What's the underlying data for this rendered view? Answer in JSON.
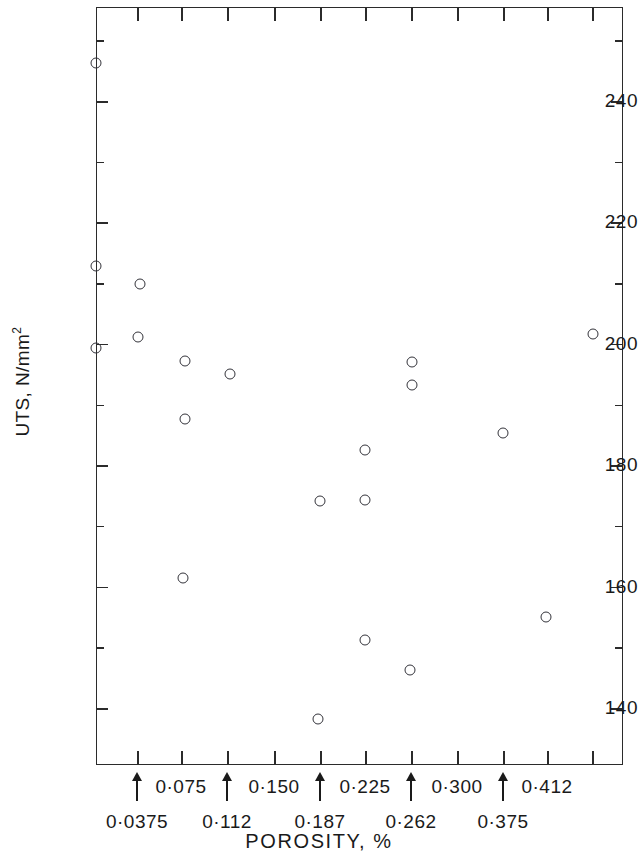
{
  "chart_data": {
    "type": "scatter",
    "title": "",
    "xlabel": "POROSITY, %",
    "ylabel": "UTS, N/mm2",
    "ylabel_display": "UTS, N/mm",
    "ylabel_exponent": "2",
    "xlim": [
      0.0,
      0.45
    ],
    "ylim": [
      133,
      252
    ],
    "grid": false,
    "legend": null,
    "y_major_ticks": [
      140,
      160,
      180,
      200,
      220,
      240
    ],
    "y_tick_labels": [
      "140",
      "160",
      "180",
      "200",
      "220",
      "240"
    ],
    "y_minor_ticks": [
      150,
      170,
      190,
      210,
      230,
      250
    ],
    "x_tick_labels_upper": [
      "0·075",
      "0·150",
      "0·225",
      "0·300",
      "0·412"
    ],
    "x_tick_labels_lower": [
      "0·0375",
      "0·112",
      "0·187",
      "0·262",
      "0·375"
    ],
    "x_arrow_positions_px": [
      137,
      227,
      320,
      411,
      503
    ],
    "x_tick_positions_px": [
      137,
      181,
      227,
      274,
      320,
      365,
      411,
      457,
      503,
      547,
      592
    ],
    "points": [
      {
        "x_px": 96,
        "y_px": 63,
        "porosity": 0.0,
        "uts": 246
      },
      {
        "x_px": 96,
        "y_px": 266,
        "porosity": 0.0,
        "uts": 212
      },
      {
        "x_px": 96,
        "y_px": 348,
        "porosity": 0.0,
        "uts": 199
      },
      {
        "x_px": 140,
        "y_px": 284,
        "porosity": 0.038,
        "uts": 209
      },
      {
        "x_px": 138,
        "y_px": 337,
        "porosity": 0.036,
        "uts": 201
      },
      {
        "x_px": 185,
        "y_px": 361,
        "porosity": 0.077,
        "uts": 197
      },
      {
        "x_px": 185,
        "y_px": 419,
        "porosity": 0.077,
        "uts": 187
      },
      {
        "x_px": 183,
        "y_px": 578,
        "porosity": 0.076,
        "uts": 161
      },
      {
        "x_px": 230,
        "y_px": 374,
        "porosity": 0.115,
        "uts": 195
      },
      {
        "x_px": 320,
        "y_px": 501,
        "porosity": 0.192,
        "uts": 174
      },
      {
        "x_px": 318,
        "y_px": 719,
        "porosity": 0.19,
        "uts": 138
      },
      {
        "x_px": 365,
        "y_px": 450,
        "porosity": 0.23,
        "uts": 182
      },
      {
        "x_px": 365,
        "y_px": 500,
        "porosity": 0.23,
        "uts": 174
      },
      {
        "x_px": 365,
        "y_px": 640,
        "porosity": 0.23,
        "uts": 151
      },
      {
        "x_px": 410,
        "y_px": 670,
        "porosity": 0.268,
        "uts": 146
      },
      {
        "x_px": 412,
        "y_px": 362,
        "porosity": 0.27,
        "uts": 197
      },
      {
        "x_px": 412,
        "y_px": 385,
        "porosity": 0.27,
        "uts": 193
      },
      {
        "x_px": 503,
        "y_px": 433,
        "porosity": 0.348,
        "uts": 185
      },
      {
        "x_px": 546,
        "y_px": 617,
        "porosity": 0.385,
        "uts": 156
      },
      {
        "x_px": 593,
        "y_px": 334,
        "porosity": 0.425,
        "uts": 201
      }
    ],
    "marker": "open-circle",
    "marker_color": "#33333a"
  },
  "axes": {
    "frame_color": "#2b2b2b"
  }
}
